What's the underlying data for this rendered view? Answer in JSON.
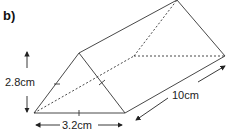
{
  "part_label": "b)",
  "labels": {
    "height": "2.8cm",
    "base": "3.2cm",
    "length": "10cm"
  },
  "colors": {
    "line": "#333333",
    "text": "#222222"
  }
}
